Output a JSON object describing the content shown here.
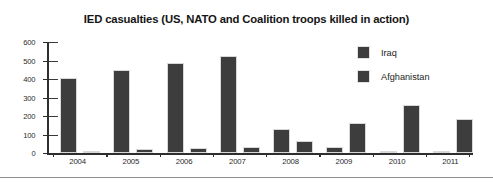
{
  "chart_data": {
    "type": "bar",
    "title": "IED casualties (US, NATO and Coalition troops killed in action)",
    "xlabel": "",
    "ylabel": "",
    "categories": [
      "2004",
      "2005",
      "2006",
      "2007",
      "2008",
      "2009",
      "2010",
      "2011"
    ],
    "series": [
      {
        "name": "Iraq",
        "values": [
          408,
          447,
          486,
          525,
          130,
          34,
          2,
          5
        ],
        "color": "#3d3d3d"
      },
      {
        "name": "Afghanistan",
        "values": [
          12,
          20,
          28,
          30,
          63,
          160,
          258,
          183
        ],
        "color": "#3d3d3d"
      }
    ],
    "ylim": [
      0,
      600
    ],
    "yticks": [
      "0",
      "100",
      "200",
      "300",
      "400",
      "500",
      "600"
    ],
    "grid": false,
    "legend_position": "top-right"
  },
  "legend": {
    "entries": [
      {
        "label": "Iraq"
      },
      {
        "label": "Afghanistan"
      }
    ]
  }
}
